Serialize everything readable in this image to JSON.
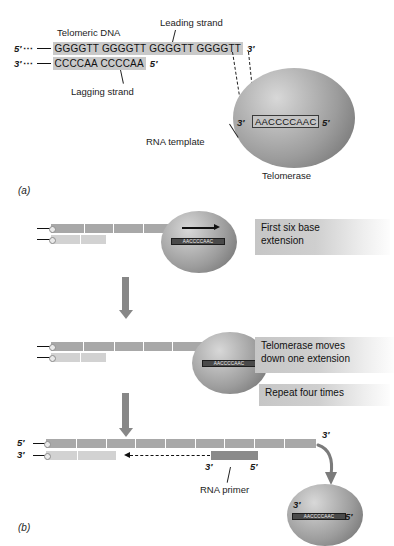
{
  "figure": {
    "panel_a_id": "(a)",
    "panel_b_id": "(b)"
  },
  "panel_a": {
    "title_label": "Telomeric DNA",
    "leading_strand_label": "Leading strand",
    "lagging_strand_label": "Lagging strand",
    "rna_template_label": "RNA template",
    "telomerase_label": "Telomerase",
    "top_strand": {
      "five_prime": "5′",
      "ellipsis": "⋯",
      "sequence": "GGGGTT GGGGTT GGGGTT GGGGTT",
      "three_prime": "3′"
    },
    "bottom_strand": {
      "three_prime": "3′",
      "ellipsis": "⋯",
      "sequence": "CCCCAA CCCCAA",
      "five_prime": "5′"
    },
    "telomerase_rna": {
      "three_prime": "3′",
      "sequence": "AACCCCAAC",
      "five_prime": "5′"
    }
  },
  "panel_b": {
    "steps": [
      {
        "label": "First six base\nextension",
        "rna_sequence": "AACCCCAAC"
      },
      {
        "label": "Telomerase moves\ndown one extension",
        "rna_sequence": "AACCCCAAC"
      },
      {
        "label": "Repeat four times"
      }
    ],
    "final": {
      "top_five_prime": "5′",
      "bottom_three_prime": "3′",
      "top_end_three_prime": "3′",
      "primer_three_prime": "3′",
      "primer_five_prime": "5′",
      "rna_primer_label": "RNA primer",
      "telomerase_rna": {
        "three_prime": "3′",
        "sequence": "AACCCCAAC",
        "five_prime": "5′"
      }
    }
  },
  "colors": {
    "top_strand": "#a8a8a8",
    "bottom_strand": "#d2d2d2",
    "primer": "#8a8a8a",
    "sphere": "#9c9c9c",
    "arrow": "#878787",
    "sequence_highlight": "#c9c9c9"
  }
}
